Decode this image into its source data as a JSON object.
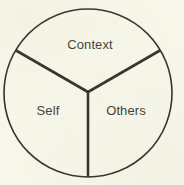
{
  "figure": {
    "background_color": "#fbfbf0",
    "stroke_color": "#1a1a17",
    "text_color": "#2b2b26"
  },
  "chart_data": {
    "type": "pie",
    "title": "",
    "subtitle": "",
    "xlabel": "",
    "ylabel": "",
    "legend_position": "none",
    "grid": false,
    "fill": "none",
    "outline_color": "#1a1a17",
    "outline_width_px": 1.6,
    "divider_color": "#1a1a17",
    "divider_width_px": 2.6,
    "center_x": 88,
    "center_y": 93,
    "radius": 84,
    "divider_origin_x": 88,
    "divider_origin_y": 92,
    "categories": [
      "Context",
      "Self",
      "Others"
    ],
    "values": [
      33.3,
      33.3,
      33.3
    ],
    "slices": [
      {
        "label": "Context",
        "value": 33.3,
        "start_angle_deg": 210,
        "end_angle_deg": 330,
        "label_x": 90,
        "label_y": 44
      },
      {
        "label": "Self",
        "value": 33.3,
        "start_angle_deg": 90,
        "end_angle_deg": 210,
        "label_x": 48,
        "label_y": 110
      },
      {
        "label": "Others",
        "value": 33.3,
        "start_angle_deg": 330,
        "end_angle_deg": 90,
        "label_x": 126,
        "label_y": 110
      }
    ],
    "divider_angles_deg": [
      90,
      210,
      330
    ]
  }
}
